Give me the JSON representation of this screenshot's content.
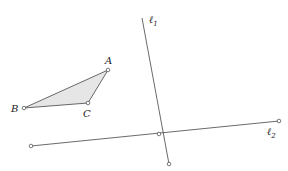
{
  "diagram": {
    "triangle": {
      "fill": "#e6e6e6",
      "stroke": "#444444",
      "vertices": {
        "A": {
          "x": 108,
          "y": 70,
          "label": "A"
        },
        "B": {
          "x": 24,
          "y": 108,
          "label": "B"
        },
        "C": {
          "x": 88,
          "y": 103,
          "label": "C"
        }
      }
    },
    "lines": [
      {
        "name": "l1",
        "label": "ℓ",
        "subscript": "1",
        "x1": 142,
        "y1": 18,
        "x2": 169,
        "y2": 164
      },
      {
        "name": "l2",
        "label": "ℓ",
        "subscript": "2",
        "x1": 31,
        "y1": 146,
        "x2": 279,
        "y2": 121
      }
    ],
    "intersection": {
      "x": 159,
      "y": 134
    },
    "stroke": "#444444"
  }
}
